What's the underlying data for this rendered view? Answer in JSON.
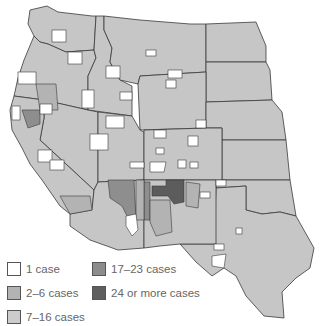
{
  "map": {
    "region": "Western United States (county-level)",
    "colors": {
      "one_case": "#ffffff",
      "two_to_six": "#b9b9b9",
      "seven_to_sixteen": "#c9c9c9",
      "seventeen_to_twentythree": "#8e8e8e",
      "twentyfour_plus": "#5c5c5c",
      "border": "#333333",
      "background_land": "#c6c6c6"
    }
  },
  "legend": {
    "items": [
      {
        "label": "1 case",
        "color": "#ffffff"
      },
      {
        "label": "2–6 cases",
        "color": "#b3b3b3"
      },
      {
        "label": "7–16 cases",
        "color": "#cccccc"
      },
      {
        "label": "17–23 cases",
        "color": "#8c8c8c"
      },
      {
        "label": "24 or more cases",
        "color": "#5e5e5e"
      }
    ]
  }
}
